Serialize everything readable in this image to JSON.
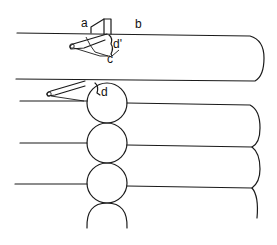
{
  "figure": {
    "type": "schematic line drawing",
    "colors": {
      "stroke": "#1a1a1a",
      "background": "#ffffff"
    }
  },
  "labels": {
    "a": "a",
    "b": "b",
    "c": "c",
    "d_prime": "d'",
    "d": "d"
  }
}
